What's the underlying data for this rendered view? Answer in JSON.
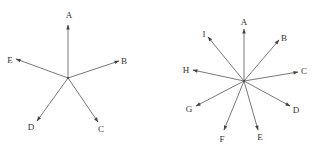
{
  "diagrams": [
    {
      "name": "five-vector-star",
      "center": [
        68,
        78
      ],
      "vectors": [
        {
          "label": "A",
          "tip": [
            68,
            25
          ],
          "label_pos": [
            69,
            18
          ]
        },
        {
          "label": "B",
          "tip": [
            119,
            61
          ],
          "label_pos": [
            124,
            64
          ]
        },
        {
          "label": "C",
          "tip": [
            98,
            122
          ],
          "label_pos": [
            101,
            132
          ]
        },
        {
          "label": "D",
          "tip": [
            37,
            121
          ],
          "label_pos": [
            31,
            130
          ]
        },
        {
          "label": "E",
          "tip": [
            16,
            59
          ],
          "label_pos": [
            10,
            63
          ]
        }
      ]
    },
    {
      "name": "nine-vector-star",
      "center": [
        244,
        81
      ],
      "vectors": [
        {
          "label": "A",
          "tip": [
            244,
            29
          ],
          "label_pos": [
            244,
            25
          ]
        },
        {
          "label": "B",
          "tip": [
            279,
            40
          ],
          "label_pos": [
            284,
            41
          ]
        },
        {
          "label": "C",
          "tip": [
            298,
            72
          ],
          "label_pos": [
            304,
            74
          ]
        },
        {
          "label": "D",
          "tip": [
            290,
            106
          ],
          "label_pos": [
            296,
            113
          ]
        },
        {
          "label": "E",
          "tip": [
            258,
            130
          ],
          "label_pos": [
            260,
            140
          ]
        },
        {
          "label": "F",
          "tip": [
            224,
            130
          ],
          "label_pos": [
            222,
            142
          ]
        },
        {
          "label": "G",
          "tip": [
            196,
            106
          ],
          "label_pos": [
            189,
            112
          ]
        },
        {
          "label": "H",
          "tip": [
            193,
            70
          ],
          "label_pos": [
            186,
            73
          ]
        },
        {
          "label": "I",
          "tip": [
            208,
            37
          ],
          "label_pos": [
            204,
            37
          ]
        }
      ]
    }
  ]
}
